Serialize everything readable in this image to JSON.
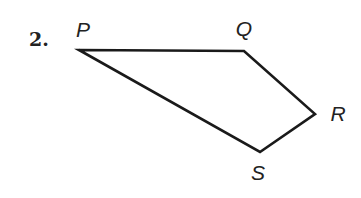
{
  "problem": {
    "number_label": "2."
  },
  "figure": {
    "shape": "quadrilateral",
    "vertices": [
      {
        "label": "P",
        "x": 79,
        "y": 50,
        "label_x": 83,
        "label_y": 37
      },
      {
        "label": "Q",
        "x": 244,
        "y": 51,
        "label_x": 244,
        "label_y": 36
      },
      {
        "label": "R",
        "x": 315,
        "y": 114,
        "label_x": 338,
        "label_y": 121
      },
      {
        "label": "S",
        "x": 260,
        "y": 152,
        "label_x": 258,
        "label_y": 180
      }
    ],
    "edges": [
      "PQ",
      "QR",
      "RS",
      "SP"
    ],
    "stroke_color": "#1a1a1a",
    "label_color": "#222222"
  }
}
